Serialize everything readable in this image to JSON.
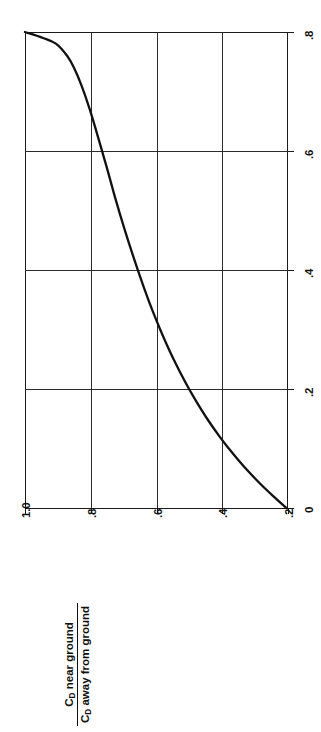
{
  "figure": {
    "background_color": "#ffffff",
    "ink_color": "#111111",
    "rotation_note": "chart printed rotated 90 degrees counter-clockwise"
  },
  "axis_title": {
    "numerator_symbol": "C",
    "numerator_subscript": "D",
    "numerator_text": " near ground",
    "denominator_symbol": "C",
    "denominator_subscript": "D",
    "denominator_text": " away from ground"
  },
  "value_axis": {
    "name": "drag-coefficient-ratio-axis",
    "ticks": [
      "1.0",
      ".8",
      ".6",
      ".4",
      ".2"
    ],
    "min": 0.2,
    "max": 1.0
  },
  "height_axis": {
    "name": "height-ratio-axis",
    "ticks": [
      "0",
      ".2",
      ".4",
      ".6",
      ".8"
    ],
    "min": 0.0,
    "max": 0.8
  },
  "chart_data": {
    "type": "line",
    "title": "",
    "subtitle": "",
    "xlabel": "",
    "ylabel": "C_D near ground / C_D away from ground",
    "xlim": [
      0.0,
      0.8
    ],
    "ylim": [
      0.2,
      1.0
    ],
    "xticks": [
      0.0,
      0.2,
      0.4,
      0.6,
      0.8
    ],
    "xticklabels": [
      "0",
      ".2",
      ".4",
      ".6",
      ".8"
    ],
    "yticks": [
      0.2,
      0.4,
      0.6,
      0.8,
      1.0
    ],
    "yticklabels": [
      ".2",
      ".4",
      ".6",
      ".8",
      "1.0"
    ],
    "grid": true,
    "legend": null,
    "orientation": "rotated-90-ccw",
    "series": [
      {
        "name": "C_D ratio vs height ratio",
        "x": [
          0.0,
          0.02,
          0.04,
          0.06,
          0.08,
          0.1,
          0.12,
          0.15,
          0.18,
          0.21,
          0.25,
          0.29,
          0.33,
          0.37,
          0.42,
          0.47,
          0.52,
          0.57,
          0.62,
          0.67,
          0.71,
          0.74,
          0.76,
          0.78,
          0.79,
          0.8
        ],
        "y": [
          0.205,
          0.245,
          0.283,
          0.318,
          0.35,
          0.38,
          0.408,
          0.446,
          0.48,
          0.511,
          0.548,
          0.581,
          0.611,
          0.638,
          0.669,
          0.698,
          0.725,
          0.75,
          0.776,
          0.803,
          0.828,
          0.851,
          0.872,
          0.905,
          0.945,
          1.0
        ]
      }
    ],
    "annotations": []
  }
}
